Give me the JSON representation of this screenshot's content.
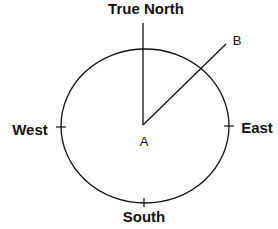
{
  "diagram": {
    "labels": {
      "north": "True North",
      "south": "South",
      "east": "East",
      "west": "West",
      "center": "A",
      "point_b": "B"
    },
    "colors": {
      "stroke": "#111111",
      "background": "#ffffff"
    }
  }
}
